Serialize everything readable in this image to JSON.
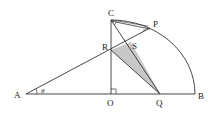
{
  "diagram": {
    "points": {
      "A": {
        "label": "A",
        "x": 26,
        "y": 94
      },
      "O": {
        "label": "O",
        "x": 111,
        "y": 94
      },
      "Q": {
        "label": "Q",
        "x": 160,
        "y": 94
      },
      "B": {
        "label": "B",
        "x": 195,
        "y": 94
      },
      "C": {
        "label": "C",
        "x": 111,
        "y": 20
      },
      "P": {
        "label": "P",
        "x": 150,
        "y": 28
      },
      "R": {
        "label": "R",
        "x": 111,
        "y": 50
      },
      "S": {
        "label": "S",
        "x": 131,
        "y": 42
      }
    },
    "angle_label": "θ",
    "shaded_region": "triangle R-S-Q",
    "right_angle_at": "O",
    "arc": "quarter circle from C to B centered at O",
    "colors": {
      "line": "#333333",
      "shade": "#c8c8c8",
      "background": "#ffffff"
    }
  }
}
